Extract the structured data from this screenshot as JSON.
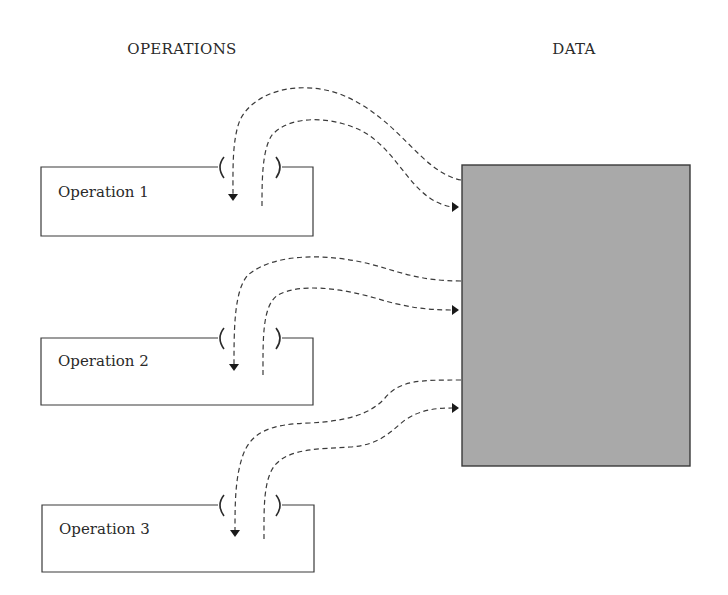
{
  "headings": {
    "operations": "OPERATIONS",
    "data": "DATA"
  },
  "operations": [
    {
      "label": "Operation 1"
    },
    {
      "label": "Operation 2"
    },
    {
      "label": "Operation 3"
    }
  ],
  "data_store": {
    "fill_color": "#a9a9a9",
    "border_color": "#3a3a3a"
  },
  "flows": [
    {
      "from": "Data",
      "to": "Operation 1",
      "direction": "read"
    },
    {
      "from": "Operation 1",
      "to": "Data",
      "direction": "write"
    },
    {
      "from": "Data",
      "to": "Operation 2",
      "direction": "read"
    },
    {
      "from": "Operation 2",
      "to": "Data",
      "direction": "write"
    },
    {
      "from": "Data",
      "to": "Operation 3",
      "direction": "read"
    },
    {
      "from": "Operation 3",
      "to": "Data",
      "direction": "write"
    }
  ]
}
